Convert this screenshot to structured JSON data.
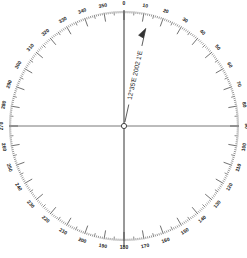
{
  "diagram": {
    "type": "compass-rose",
    "center": [
      124,
      126
    ],
    "ring_radius": 115,
    "label_radius": 122,
    "degree_range": [
      0,
      360
    ],
    "label_step_deg": 10,
    "minor_tick_step_deg": 1,
    "labels": [
      "0",
      "10",
      "20",
      "30",
      "40",
      "50",
      "60",
      "70",
      "80",
      "90",
      "100",
      "110",
      "120",
      "130",
      "140",
      "150",
      "160",
      "170",
      "180",
      "190",
      "200",
      "210",
      "220",
      "230",
      "240",
      "250",
      "260",
      "270",
      "280",
      "290",
      "300",
      "310",
      "320",
      "330",
      "340",
      "350"
    ],
    "annotation": {
      "text": "12°35'E 2002 1'E",
      "angle_deg": 12.6,
      "description": "magnetic variation arrow"
    },
    "colors": {
      "line": "#333333",
      "background": "#ffffff"
    }
  }
}
